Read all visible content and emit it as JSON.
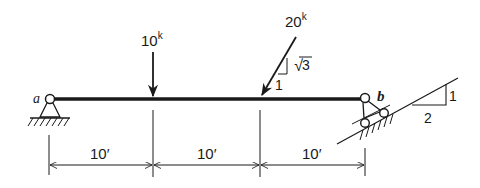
{
  "diagram": {
    "type": "beam-free-body",
    "colors": {
      "ink": "#1a1a1a",
      "background": "#ffffff"
    },
    "supports": {
      "a": {
        "label": "a",
        "kind": "pin"
      },
      "b": {
        "label": "b",
        "kind": "roller-on-incline"
      }
    },
    "loads": [
      {
        "id": "load1",
        "magnitude": "10",
        "unit": "k",
        "direction": "vertical-down"
      },
      {
        "id": "load2",
        "magnitude": "20",
        "unit": "k",
        "direction": "inclined",
        "slope_rise": "√3",
        "slope_run": "1"
      }
    ],
    "incline": {
      "rise": "1",
      "run": "2"
    },
    "spans": [
      {
        "label": "10′"
      },
      {
        "label": "10′"
      },
      {
        "label": "10′"
      }
    ]
  }
}
